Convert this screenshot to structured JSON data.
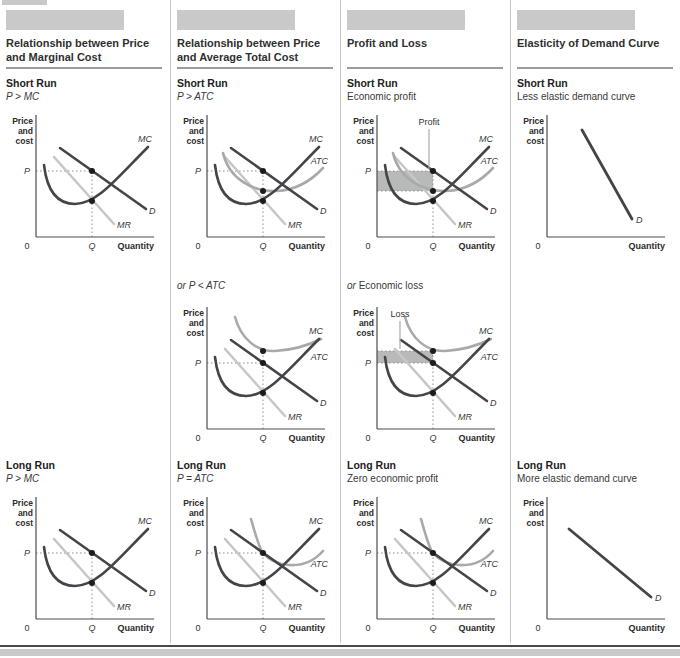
{
  "columns": [
    {
      "title": "Relationship between Price and Marginal Cost",
      "short_run": {
        "heading": "Short Run",
        "sub": {
          "prefix": "",
          "text": "P > MC",
          "style": "it"
        },
        "chart": "col1_sr"
      },
      "mid": null,
      "long_run": {
        "heading": "Long Run",
        "sub": {
          "prefix": "",
          "text": "P > MC",
          "style": "it"
        },
        "chart": "col1_lr"
      }
    },
    {
      "title": "Relationship between Price and Average Total Cost",
      "short_run": {
        "heading": "Short Run",
        "sub": {
          "prefix": "",
          "text": "P > ATC",
          "style": "it"
        },
        "chart": "col2_sr"
      },
      "mid": {
        "sub": {
          "prefix": "or ",
          "text": "P < ATC",
          "style": "it"
        },
        "chart": "col2_mid"
      },
      "long_run": {
        "heading": "Long Run",
        "sub": {
          "prefix": "",
          "text": "P = ATC",
          "style": "it"
        },
        "chart": "col2_lr"
      }
    },
    {
      "title": "Profit and Loss",
      "short_run": {
        "heading": "Short Run",
        "sub": {
          "prefix": "",
          "text": "Economic profit",
          "style": "rm"
        },
        "chart": "col3_sr"
      },
      "mid": {
        "sub": {
          "prefix": "or ",
          "text": "Economic loss",
          "style": "rm"
        },
        "chart": "col3_mid"
      },
      "long_run": {
        "heading": "Long Run",
        "sub": {
          "prefix": "",
          "text": "Zero economic profit",
          "style": "rm"
        },
        "chart": "col3_lr"
      }
    },
    {
      "title": "Elasticity of Demand Curve",
      "short_run": {
        "heading": "Short Run",
        "sub": {
          "prefix": "",
          "text": "Less elastic demand curve",
          "style": "rm"
        },
        "chart": "col4_sr"
      },
      "mid": null,
      "long_run": {
        "heading": "Long Run",
        "sub": {
          "prefix": "",
          "text": "More elastic demand curve",
          "style": "rm"
        },
        "chart": "col4_lr"
      }
    }
  ],
  "chart_common": {
    "y_axis_lines": [
      "Price",
      "and",
      "cost"
    ],
    "x_axis_label": "Quantity",
    "origin": "0",
    "p": "P",
    "q": "Q"
  },
  "colors": {
    "dark": "#454549",
    "light": "#c6c8c5",
    "mid": "#a7aaa8",
    "dot": "#1c1c1c",
    "guide": "#8f8f8f",
    "shade": "#b7bab8",
    "leader": "#a9a9a9",
    "axis": "#4c4c4c",
    "band": "#c9c9c9",
    "rule": "#9b9b9b",
    "divider": "#c6c6c6",
    "footer_rule": "#4a4a4a",
    "text": "#2f2f2f"
  },
  "chart_data": [
    {
      "id": "col1_sr",
      "type": "line",
      "curves": [
        {
          "name": "MR",
          "color": "light",
          "w": 2.6,
          "path": "M54,46 L114,113",
          "lx": 117,
          "ly": 117,
          "anchor": "start"
        },
        {
          "name": "D",
          "color": "dark",
          "w": 2.6,
          "path": "M60,37 L146,98",
          "lx": 149,
          "ly": 103,
          "anchor": "start"
        },
        {
          "name": "MC",
          "color": "dark",
          "w": 2.6,
          "path": "M44,54 C47,80 57,93 75,93 C97,93 116,68 148,36",
          "lx": 152,
          "ly": 31,
          "anchor": "end"
        }
      ],
      "guides": [
        [
          36,
          60,
          92,
          60
        ],
        [
          92,
          126,
          92,
          60
        ]
      ],
      "p": true,
      "q": true,
      "dots": [
        [
          92,
          60
        ],
        [
          92,
          90
        ]
      ]
    },
    {
      "id": "col2_sr",
      "type": "line",
      "curves": [
        {
          "name": "MR",
          "color": "light",
          "w": 2.6,
          "path": "M54,46 L114,113",
          "lx": 117,
          "ly": 117,
          "anchor": "start"
        },
        {
          "name": "ATC",
          "color": "mid",
          "w": 2.6,
          "path": "M52,42 C58,68 82,81 106,80 C124,79 140,70 152,57",
          "lx": 157,
          "ly": 53,
          "anchor": "end"
        },
        {
          "name": "D",
          "color": "dark",
          "w": 2.6,
          "path": "M60,37 L146,98",
          "lx": 149,
          "ly": 103,
          "anchor": "start"
        },
        {
          "name": "MC",
          "color": "dark",
          "w": 2.6,
          "path": "M44,54 C47,80 57,93 75,93 C97,93 116,68 148,36",
          "lx": 152,
          "ly": 31,
          "anchor": "end"
        }
      ],
      "guides": [
        [
          36,
          60,
          92,
          60
        ],
        [
          92,
          126,
          92,
          60
        ]
      ],
      "p": true,
      "q": true,
      "dots": [
        [
          92,
          60
        ],
        [
          92,
          80
        ],
        [
          92,
          90
        ]
      ]
    },
    {
      "id": "col3_sr",
      "type": "line",
      "shade": {
        "x": 36,
        "y": 60,
        "w": 56,
        "h": 20,
        "name": "profit-region"
      },
      "annotation": {
        "text": "Profit",
        "x": 88,
        "y": 14,
        "leader": [
          88,
          18,
          88,
          58
        ]
      },
      "curves": [
        {
          "name": "MR",
          "color": "light",
          "w": 2.6,
          "path": "M54,46 L114,113",
          "lx": 117,
          "ly": 117,
          "anchor": "start"
        },
        {
          "name": "ATC",
          "color": "mid",
          "w": 2.6,
          "path": "M52,42 C58,68 82,81 106,80 C124,79 140,70 152,57",
          "lx": 157,
          "ly": 53,
          "anchor": "end"
        },
        {
          "name": "D",
          "color": "dark",
          "w": 2.6,
          "path": "M60,37 L146,98",
          "lx": 149,
          "ly": 103,
          "anchor": "start"
        },
        {
          "name": "MC",
          "color": "dark",
          "w": 2.6,
          "path": "M44,54 C47,80 57,93 75,93 C97,93 116,68 148,36",
          "lx": 152,
          "ly": 31,
          "anchor": "end"
        }
      ],
      "guides": [
        [
          36,
          60,
          92,
          60
        ],
        [
          36,
          80,
          92,
          80
        ],
        [
          92,
          126,
          92,
          60
        ]
      ],
      "p": true,
      "q": true,
      "dots": [
        [
          92,
          60
        ],
        [
          92,
          80
        ],
        [
          92,
          90
        ]
      ]
    },
    {
      "id": "col2_mid",
      "type": "line",
      "curves": [
        {
          "name": "MR",
          "color": "light",
          "w": 2.6,
          "path": "M54,46 L114,113",
          "lx": 117,
          "ly": 117,
          "anchor": "start"
        },
        {
          "name": "ATC",
          "color": "mid",
          "w": 2.6,
          "path": "M64,14 C70,36 86,49 104,48 C122,47 138,42 150,36",
          "lx": 157,
          "ly": 57,
          "anchor": "end"
        },
        {
          "name": "D",
          "color": "dark",
          "w": 2.6,
          "path": "M60,37 L146,98",
          "lx": 149,
          "ly": 103,
          "anchor": "start"
        },
        {
          "name": "MC",
          "color": "dark",
          "w": 2.6,
          "path": "M44,54 C47,80 57,93 75,93 C97,93 116,68 148,36",
          "lx": 152,
          "ly": 31,
          "anchor": "end"
        }
      ],
      "guides": [
        [
          36,
          60,
          92,
          60
        ],
        [
          92,
          126,
          92,
          48
        ]
      ],
      "p": true,
      "q": true,
      "dots": [
        [
          92,
          48
        ],
        [
          92,
          60
        ],
        [
          92,
          90
        ]
      ]
    },
    {
      "id": "col3_mid",
      "type": "line",
      "shade": {
        "x": 36,
        "y": 48,
        "w": 56,
        "h": 12,
        "name": "loss-region"
      },
      "annotation": {
        "text": "Loss",
        "x": 59,
        "y": 14,
        "leader": [
          59,
          18,
          59,
          46
        ]
      },
      "curves": [
        {
          "name": "MR",
          "color": "light",
          "w": 2.6,
          "path": "M54,46 L114,113",
          "lx": 117,
          "ly": 117,
          "anchor": "start"
        },
        {
          "name": "ATC",
          "color": "mid",
          "w": 2.6,
          "path": "M64,14 C70,36 86,49 104,48 C122,47 138,42 150,36",
          "lx": 157,
          "ly": 57,
          "anchor": "end"
        },
        {
          "name": "D",
          "color": "dark",
          "w": 2.6,
          "path": "M60,37 L146,98",
          "lx": 149,
          "ly": 103,
          "anchor": "start"
        },
        {
          "name": "MC",
          "color": "dark",
          "w": 2.6,
          "path": "M44,54 C47,80 57,93 75,93 C97,93 116,68 148,36",
          "lx": 152,
          "ly": 31,
          "anchor": "end"
        }
      ],
      "guides": [
        [
          36,
          48,
          92,
          48
        ],
        [
          36,
          60,
          92,
          60
        ],
        [
          92,
          126,
          92,
          48
        ]
      ],
      "p": true,
      "q": true,
      "dots": [
        [
          92,
          48
        ],
        [
          92,
          60
        ],
        [
          92,
          90
        ]
      ]
    },
    {
      "id": "col1_lr",
      "type": "line",
      "curves": [
        {
          "name": "MR",
          "color": "light",
          "w": 2.6,
          "path": "M54,46 L114,113",
          "lx": 117,
          "ly": 117,
          "anchor": "start"
        },
        {
          "name": "D",
          "color": "dark",
          "w": 2.6,
          "path": "M60,37 L146,98",
          "lx": 149,
          "ly": 103,
          "anchor": "start"
        },
        {
          "name": "MC",
          "color": "dark",
          "w": 2.6,
          "path": "M44,54 C47,80 57,93 75,93 C97,93 116,68 148,36",
          "lx": 152,
          "ly": 31,
          "anchor": "end"
        }
      ],
      "guides": [
        [
          36,
          60,
          92,
          60
        ],
        [
          92,
          126,
          92,
          60
        ]
      ],
      "p": true,
      "q": true,
      "dots": [
        [
          92,
          60
        ],
        [
          92,
          90
        ]
      ]
    },
    {
      "id": "col2_lr",
      "type": "line",
      "curves": [
        {
          "name": "MR",
          "color": "light",
          "w": 2.6,
          "path": "M54,46 L114,113",
          "lx": 117,
          "ly": 117,
          "anchor": "start"
        },
        {
          "name": "ATC",
          "color": "mid",
          "w": 2.6,
          "path": "M80,26 C85,43 88,55 92,60 C97,66 106,71 118,72 C132,73 144,67 152,58",
          "lx": 157,
          "ly": 74,
          "anchor": "end"
        },
        {
          "name": "D",
          "color": "dark",
          "w": 2.6,
          "path": "M60,37 L146,98",
          "lx": 149,
          "ly": 103,
          "anchor": "start"
        },
        {
          "name": "MC",
          "color": "dark",
          "w": 2.6,
          "path": "M44,54 C47,80 57,93 75,93 C97,93 116,68 148,36",
          "lx": 152,
          "ly": 31,
          "anchor": "end"
        }
      ],
      "guides": [
        [
          36,
          60,
          92,
          60
        ],
        [
          92,
          126,
          92,
          60
        ]
      ],
      "p": true,
      "q": true,
      "dots": [
        [
          92,
          60
        ],
        [
          92,
          90
        ]
      ]
    },
    {
      "id": "col3_lr",
      "type": "line",
      "curves": [
        {
          "name": "MR",
          "color": "light",
          "w": 2.6,
          "path": "M54,46 L114,113",
          "lx": 117,
          "ly": 117,
          "anchor": "start"
        },
        {
          "name": "ATC",
          "color": "mid",
          "w": 2.6,
          "path": "M80,26 C85,43 88,55 92,60 C97,66 106,71 118,72 C132,73 144,67 152,58",
          "lx": 157,
          "ly": 74,
          "anchor": "end"
        },
        {
          "name": "D",
          "color": "dark",
          "w": 2.6,
          "path": "M60,37 L146,98",
          "lx": 149,
          "ly": 103,
          "anchor": "start"
        },
        {
          "name": "MC",
          "color": "dark",
          "w": 2.6,
          "path": "M44,54 C47,80 57,93 75,93 C97,93 116,68 148,36",
          "lx": 152,
          "ly": 31,
          "anchor": "end"
        }
      ],
      "guides": [
        [
          36,
          60,
          92,
          60
        ],
        [
          92,
          126,
          92,
          60
        ]
      ],
      "p": true,
      "q": true,
      "dots": [
        [
          92,
          60
        ],
        [
          92,
          90
        ]
      ]
    },
    {
      "id": "col4_sr",
      "type": "line",
      "curves": [
        {
          "name": "D",
          "color": "dark",
          "w": 2.8,
          "path": "M71,19 L121,108",
          "lx": 125,
          "ly": 112,
          "anchor": "start"
        }
      ],
      "guides": [],
      "p": false,
      "q": false,
      "dots": []
    },
    {
      "id": "col4_lr",
      "type": "line",
      "curves": [
        {
          "name": "D",
          "color": "dark",
          "w": 2.8,
          "path": "M58,36 L140,104",
          "lx": 144,
          "ly": 108,
          "anchor": "start"
        }
      ],
      "guides": [],
      "p": false,
      "q": false,
      "dots": []
    }
  ]
}
